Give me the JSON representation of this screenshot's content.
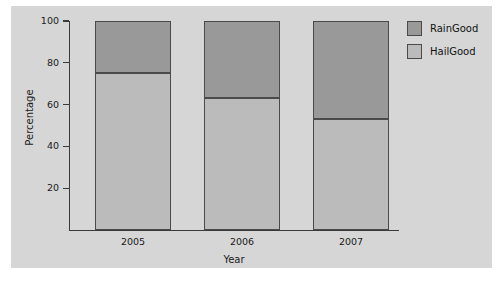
{
  "chart_data": {
    "type": "bar",
    "subtype": "stacked-percentage",
    "title": "",
    "xlabel": "Year",
    "ylabel": "Percentage",
    "categories": [
      "2005",
      "2006",
      "2007"
    ],
    "series": [
      {
        "name": "HailGood",
        "values": [
          75,
          63,
          53
        ],
        "color": "#bbbbbb"
      },
      {
        "name": "RainGood",
        "values": [
          25,
          37,
          47
        ],
        "color": "#999999"
      }
    ],
    "stack_order_bottom_to_top": [
      "HailGood",
      "RainGood"
    ],
    "ylim": [
      0,
      100
    ],
    "yticks": [
      20,
      40,
      60,
      80,
      100
    ],
    "ytick_labels": [
      "20",
      "40",
      "60",
      "80",
      "100"
    ],
    "grid": false,
    "legend_position": "right",
    "legend_entries": [
      "RainGood",
      "HailGood"
    ],
    "plot_background": "#d6d6d6",
    "figure_background": "#ffffff",
    "axis_color": "#3a3a3a",
    "bar_edge_color": "#4a4a4a"
  },
  "axes": {
    "y_title": "Percentage",
    "x_title": "Year"
  },
  "legend": {
    "items": [
      {
        "label": "RainGood",
        "color": "#999999"
      },
      {
        "label": "HailGood",
        "color": "#bbbbbb"
      }
    ]
  }
}
